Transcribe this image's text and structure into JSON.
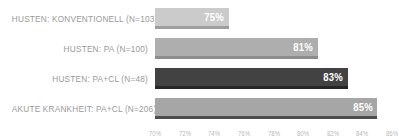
{
  "chart_data": {
    "type": "bar",
    "orientation": "horizontal",
    "title": "",
    "xlabel": "",
    "ylabel": "",
    "grid": false,
    "legend": false,
    "categories": [
      "HUSTEN: KONVENTIONELL (N=103)",
      "HUSTEN: PA (N=100)",
      "HUSTEN: PA+CL (N=48)",
      "AKUTE KRANKHEIT: PA+CL (N=206)"
    ],
    "values": [
      75,
      81,
      83,
      85
    ],
    "value_labels": [
      "75%",
      "81%",
      "83%",
      "85%"
    ],
    "bar_colors": [
      "#cbcbcb",
      "#aeaeae",
      "#424242",
      "#a6a6a6"
    ],
    "bar_edge_colors": [
      "#9e9e9e",
      "#8d8d8d",
      "#262626",
      "#4d4d4d"
    ],
    "xlim": [
      70,
      86
    ],
    "xticks": [
      70,
      72,
      74,
      76,
      78,
      80,
      82,
      84,
      86
    ],
    "xtick_labels": [
      "70%",
      "72%",
      "74%",
      "76%",
      "78%",
      "80%",
      "82%",
      "84%",
      "86%"
    ]
  },
  "colors": {
    "background": "#ffffff",
    "category_label_text": "#9a9a9a",
    "tick_label_text": "#b9b9b9",
    "bar_value_text": "#ffffff"
  }
}
